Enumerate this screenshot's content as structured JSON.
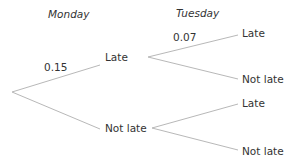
{
  "headers": {
    "stage1": "Monday",
    "stage2": "Tuesday"
  },
  "tree": {
    "root": {
      "branches": [
        {
          "label": "Late",
          "probability": "0.15",
          "branches": [
            {
              "label": "Late",
              "probability": "0.07"
            },
            {
              "label": "Not late",
              "probability": ""
            }
          ]
        },
        {
          "label": "Not late",
          "probability": "",
          "branches": [
            {
              "label": "Late",
              "probability": ""
            },
            {
              "label": "Not late",
              "probability": ""
            }
          ]
        }
      ]
    }
  },
  "colors": {
    "line": "#b8b8b8",
    "text": "#333333"
  }
}
